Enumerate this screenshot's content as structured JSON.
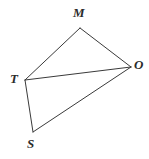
{
  "figure": {
    "name": "quadrilateral-mtso",
    "background_color": "#ffffff",
    "stroke_color": "#3a3a3a",
    "label_color": "#2b2b2b",
    "width": 149,
    "height": 159,
    "vertices": [
      {
        "id": "M",
        "label": "M",
        "x": 80,
        "y": 28,
        "label_x": 73,
        "label_y": 6
      },
      {
        "id": "O",
        "label": "O",
        "x": 131,
        "y": 67,
        "label_x": 134,
        "label_y": 58
      },
      {
        "id": "T",
        "label": "T",
        "x": 25,
        "y": 80,
        "label_x": 10,
        "label_y": 72
      },
      {
        "id": "S",
        "label": "S",
        "x": 33,
        "y": 132,
        "label_x": 27,
        "label_y": 137
      }
    ],
    "edges": [
      {
        "id": "MT",
        "from": "M",
        "to": "T",
        "x1": 80,
        "y1": 28,
        "x2": 25,
        "y2": 80
      },
      {
        "id": "MO",
        "from": "M",
        "to": "O",
        "x1": 80,
        "y1": 28,
        "x2": 131,
        "y2": 67
      },
      {
        "id": "TO",
        "from": "T",
        "to": "O",
        "x1": 25,
        "y1": 80,
        "x2": 131,
        "y2": 67
      },
      {
        "id": "TS",
        "from": "T",
        "to": "S",
        "x1": 25,
        "y1": 80,
        "x2": 33,
        "y2": 132
      },
      {
        "id": "SO",
        "from": "S",
        "to": "O",
        "x1": 33,
        "y1": 132,
        "x2": 131,
        "y2": 67
      }
    ]
  }
}
